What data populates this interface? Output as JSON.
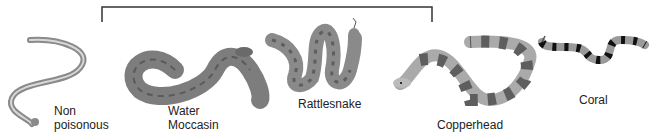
{
  "diagram": {
    "group_bracket": {
      "covers": [
        "Water Moccasin",
        "Rattlesnake",
        "Copperhead"
      ]
    },
    "snakes": [
      {
        "id": "non-poisonous",
        "label_line1": "Non",
        "label_line2": "poisonous"
      },
      {
        "id": "water-moccasin",
        "label_line1": "Water",
        "label_line2": "Moccasin"
      },
      {
        "id": "rattlesnake",
        "label_line1": "Rattlesnake"
      },
      {
        "id": "copperhead",
        "label_line1": "Copperhead"
      },
      {
        "id": "coral",
        "label_line1": "Coral"
      }
    ],
    "colors": {
      "body": "#8e8e8e",
      "pattern": "#5a5a5a",
      "light": "#c8c8c8",
      "band": "#111111"
    }
  }
}
